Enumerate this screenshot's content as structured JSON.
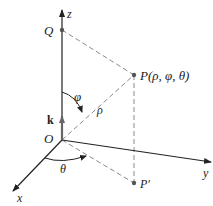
{
  "diagram": {
    "type": "spherical-coordinates",
    "axes": {
      "x": {
        "label": "x"
      },
      "y": {
        "label": "y"
      },
      "z": {
        "label": "z"
      }
    },
    "origin": {
      "label": "O"
    },
    "unit_vector": {
      "label": "k"
    },
    "points": {
      "Q": {
        "label": "Q"
      },
      "P": {
        "label": "P(ρ, φ, θ)"
      },
      "P_prime": {
        "label": "P′"
      }
    },
    "angles": {
      "phi": {
        "label": "φ"
      },
      "theta": {
        "label": "θ"
      }
    },
    "distance": {
      "rho": {
        "label": "ρ"
      }
    },
    "colors": {
      "axis": "#222222",
      "dashed": "#8a8a8a",
      "point": "#555555",
      "k_vector": "#666666"
    }
  }
}
